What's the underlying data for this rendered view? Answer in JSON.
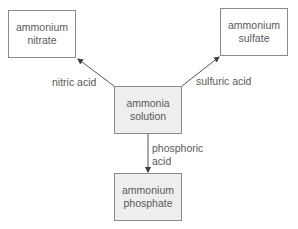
{
  "diagram": {
    "nodes": {
      "center": {
        "line1": "ammonia",
        "line2": "solution"
      },
      "top_left": {
        "line1": "ammonium",
        "line2": "nitrate"
      },
      "top_right": {
        "line1": "ammonium",
        "line2": "sulfate"
      },
      "bottom": {
        "line1": "ammonium",
        "line2": "phosphate"
      }
    },
    "edges": {
      "to_nitrate": {
        "label": "nitric acid"
      },
      "to_sulfate": {
        "label": "sulfuric acid"
      },
      "to_phosphate": {
        "line1": "phosphoric",
        "line2": "acid"
      }
    },
    "colors": {
      "border": "#8a8a8a",
      "gray_fill": "#eeeeee",
      "text": "#5a5a5a",
      "arrow": "#4a4a4a"
    }
  }
}
